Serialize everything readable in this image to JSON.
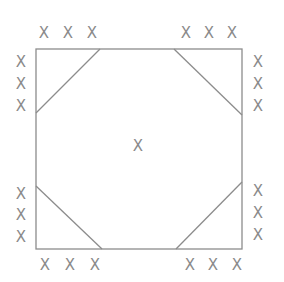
{
  "diagram": {
    "type": "square-with-corner-triangles",
    "colors": {
      "line": "#8c8c8c",
      "mark": "#8a8a8a",
      "background": "#ffffff"
    },
    "square": {
      "x1": 36,
      "y1": 49,
      "x2": 242,
      "y2": 249
    },
    "corner_cuts": [
      {
        "name": "top-left",
        "from": [
          100,
          49
        ],
        "to": [
          36,
          113
        ]
      },
      {
        "name": "top-right",
        "from": [
          174,
          49
        ],
        "to": [
          242,
          115
        ]
      },
      {
        "name": "bottom-left",
        "from": [
          36,
          186
        ],
        "to": [
          102,
          249
        ]
      },
      {
        "name": "bottom-right",
        "from": [
          176,
          249
        ],
        "to": [
          242,
          182
        ]
      }
    ],
    "center_mark": {
      "label": "X",
      "x": 138,
      "y": 146
    },
    "marks": [
      {
        "group": "top-left-top",
        "label": "X",
        "x": 44,
        "y": 33
      },
      {
        "group": "top-left-top",
        "label": "X",
        "x": 68,
        "y": 33
      },
      {
        "group": "top-left-top",
        "label": "X",
        "x": 92,
        "y": 33
      },
      {
        "group": "top-right-top",
        "label": "X",
        "x": 186,
        "y": 33
      },
      {
        "group": "top-right-top",
        "label": "X",
        "x": 209,
        "y": 33
      },
      {
        "group": "top-right-top",
        "label": "X",
        "x": 232,
        "y": 33
      },
      {
        "group": "left-top",
        "label": "X",
        "x": 21,
        "y": 62
      },
      {
        "group": "left-top",
        "label": "X",
        "x": 21,
        "y": 84
      },
      {
        "group": "left-top",
        "label": "X",
        "x": 21,
        "y": 106
      },
      {
        "group": "left-bottom",
        "label": "X",
        "x": 21,
        "y": 194
      },
      {
        "group": "left-bottom",
        "label": "X",
        "x": 21,
        "y": 215
      },
      {
        "group": "left-bottom",
        "label": "X",
        "x": 21,
        "y": 237
      },
      {
        "group": "right-top",
        "label": "X",
        "x": 258,
        "y": 62
      },
      {
        "group": "right-top",
        "label": "X",
        "x": 258,
        "y": 84
      },
      {
        "group": "right-top",
        "label": "X",
        "x": 258,
        "y": 106
      },
      {
        "group": "right-bottom",
        "label": "X",
        "x": 258,
        "y": 191
      },
      {
        "group": "right-bottom",
        "label": "X",
        "x": 258,
        "y": 213
      },
      {
        "group": "right-bottom",
        "label": "X",
        "x": 258,
        "y": 235
      },
      {
        "group": "bottom-left",
        "label": "X",
        "x": 45,
        "y": 265
      },
      {
        "group": "bottom-left",
        "label": "X",
        "x": 70,
        "y": 265
      },
      {
        "group": "bottom-left",
        "label": "X",
        "x": 95,
        "y": 265
      },
      {
        "group": "bottom-right",
        "label": "X",
        "x": 190,
        "y": 265
      },
      {
        "group": "bottom-right",
        "label": "X",
        "x": 213,
        "y": 265
      },
      {
        "group": "bottom-right",
        "label": "X",
        "x": 237,
        "y": 265
      }
    ]
  }
}
